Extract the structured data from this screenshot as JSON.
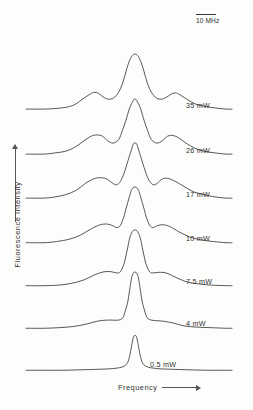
{
  "figure": {
    "axes": {
      "y_label": "Fluorescence  Intensity",
      "x_label": "Frequency"
    },
    "scale_bar": {
      "label": "10 MHz"
    }
  },
  "chart_data": {
    "type": "line",
    "title": "",
    "subtitle": "",
    "xlabel": "Frequency",
    "ylabel": "Fluorescence  Intensity",
    "xlim": [
      -50,
      50
    ],
    "ylim": [
      0,
      1
    ],
    "grid": false,
    "legend_position": "inline-right",
    "annotations": [
      {
        "text": "10 MHz",
        "role": "horizontal-scale-bar",
        "x_px": 196,
        "y_px": 14,
        "length_px": 20
      }
    ],
    "axis_ticks": {
      "x": [],
      "y": []
    },
    "series": [
      {
        "name": "35 mW",
        "power_mw": 35,
        "label": "35 mW",
        "baseline_y_px": 112,
        "peak_center_x_px": 135,
        "peak_height_rel": 1.0,
        "sideband_offset_mhz": 22,
        "sideband_height_rel": 0.34,
        "x": [
          -50,
          -44,
          -38,
          -33,
          -28,
          -24,
          -22,
          -20,
          -17,
          -14,
          -11,
          -8,
          -6,
          -4,
          -2,
          0,
          2,
          4,
          6,
          8,
          11,
          14,
          17,
          20,
          22,
          24,
          28,
          33,
          38,
          44,
          50
        ],
        "values": [
          0.05,
          0.06,
          0.08,
          0.13,
          0.24,
          0.32,
          0.34,
          0.32,
          0.25,
          0.22,
          0.26,
          0.4,
          0.58,
          0.8,
          0.95,
          1.0,
          0.95,
          0.8,
          0.58,
          0.4,
          0.26,
          0.22,
          0.25,
          0.31,
          0.33,
          0.31,
          0.23,
          0.14,
          0.1,
          0.07,
          0.05
        ]
      },
      {
        "name": "26 mW",
        "power_mw": 26,
        "label": "26 mW",
        "baseline_y_px": 157,
        "peak_center_x_px": 135,
        "peak_height_rel": 1.0,
        "sideband_offset_mhz": 18,
        "sideband_height_rel": 0.38,
        "x": [
          -50,
          -44,
          -38,
          -33,
          -28,
          -24,
          -21,
          -18,
          -15,
          -12,
          -9,
          -7,
          -5,
          -3,
          -1,
          0,
          1,
          3,
          5,
          7,
          9,
          12,
          15,
          18,
          21,
          24,
          28,
          33,
          38,
          44,
          50
        ],
        "values": [
          0.05,
          0.07,
          0.1,
          0.17,
          0.28,
          0.36,
          0.38,
          0.36,
          0.28,
          0.24,
          0.3,
          0.45,
          0.63,
          0.84,
          0.97,
          1.0,
          0.97,
          0.84,
          0.63,
          0.45,
          0.3,
          0.24,
          0.28,
          0.36,
          0.37,
          0.33,
          0.24,
          0.15,
          0.1,
          0.07,
          0.05
        ]
      },
      {
        "name": "17 mW",
        "power_mw": 17,
        "label": "17 mW",
        "baseline_y_px": 201,
        "peak_center_x_px": 135,
        "peak_height_rel": 1.0,
        "sideband_offset_mhz": 15,
        "sideband_height_rel": 0.4,
        "x": [
          -50,
          -44,
          -38,
          -32,
          -27,
          -22,
          -18,
          -15,
          -12,
          -10,
          -8,
          -6,
          -4,
          -2,
          -1,
          0,
          1,
          2,
          4,
          6,
          8,
          10,
          12,
          15,
          18,
          22,
          27,
          32,
          38,
          44,
          50
        ],
        "values": [
          0.05,
          0.07,
          0.11,
          0.19,
          0.31,
          0.39,
          0.4,
          0.37,
          0.3,
          0.28,
          0.34,
          0.48,
          0.68,
          0.88,
          0.98,
          1.0,
          0.98,
          0.88,
          0.68,
          0.48,
          0.34,
          0.28,
          0.3,
          0.38,
          0.39,
          0.34,
          0.25,
          0.16,
          0.11,
          0.07,
          0.05
        ]
      },
      {
        "name": "10 mW",
        "power_mw": 10,
        "label": "10 mW",
        "baseline_y_px": 245,
        "peak_center_x_px": 135,
        "peak_height_rel": 1.0,
        "sideband_offset_mhz": 12,
        "sideband_height_rel": 0.36,
        "x": [
          -50,
          -43,
          -36,
          -30,
          -24,
          -19,
          -15,
          -12,
          -10,
          -8,
          -6,
          -5,
          -3,
          -2,
          -1,
          0,
          1,
          2,
          3,
          5,
          6,
          8,
          10,
          12,
          15,
          19,
          24,
          30,
          36,
          43,
          50
        ],
        "values": [
          0.04,
          0.06,
          0.1,
          0.17,
          0.28,
          0.35,
          0.36,
          0.33,
          0.3,
          0.34,
          0.5,
          0.62,
          0.84,
          0.94,
          0.99,
          1.0,
          0.99,
          0.94,
          0.84,
          0.62,
          0.5,
          0.34,
          0.3,
          0.33,
          0.35,
          0.32,
          0.23,
          0.14,
          0.09,
          0.06,
          0.04
        ]
      },
      {
        "name": "7.5 mW",
        "power_mw": 7.5,
        "label": "7.5 mW",
        "baseline_y_px": 288,
        "peak_center_x_px": 135,
        "peak_height_rel": 1.0,
        "sideband_offset_mhz": 10,
        "sideband_height_rel": 0.28,
        "x": [
          -50,
          -42,
          -35,
          -28,
          -22,
          -17,
          -13,
          -10,
          -8,
          -6,
          -5,
          -4,
          -3,
          -2,
          -1,
          0,
          1,
          2,
          3,
          4,
          5,
          6,
          8,
          10,
          13,
          17,
          22,
          28,
          35,
          42,
          50
        ],
        "values": [
          0.04,
          0.05,
          0.08,
          0.14,
          0.23,
          0.28,
          0.28,
          0.26,
          0.28,
          0.42,
          0.55,
          0.7,
          0.85,
          0.94,
          0.99,
          1.0,
          0.99,
          0.94,
          0.85,
          0.7,
          0.55,
          0.42,
          0.28,
          0.26,
          0.27,
          0.26,
          0.19,
          0.11,
          0.07,
          0.05,
          0.04
        ]
      },
      {
        "name": "4 mW",
        "power_mw": 4,
        "label": "4 mW",
        "baseline_y_px": 330,
        "peak_center_x_px": 135,
        "peak_height_rel": 1.0,
        "sideband_offset_mhz": 7,
        "sideband_height_rel": 0.17,
        "x": [
          -50,
          -42,
          -34,
          -27,
          -21,
          -16,
          -12,
          -9,
          -7,
          -6,
          -4,
          -3,
          -2,
          -1.5,
          -1,
          0,
          1,
          1.5,
          2,
          3,
          4,
          6,
          7,
          9,
          12,
          16,
          21,
          27,
          34,
          42,
          50
        ],
        "values": [
          0.03,
          0.04,
          0.06,
          0.1,
          0.15,
          0.17,
          0.17,
          0.17,
          0.2,
          0.26,
          0.48,
          0.68,
          0.88,
          0.94,
          0.98,
          1.0,
          0.98,
          0.94,
          0.88,
          0.68,
          0.48,
          0.26,
          0.2,
          0.17,
          0.16,
          0.15,
          0.12,
          0.07,
          0.05,
          0.04,
          0.03
        ]
      },
      {
        "name": "0.5 mW",
        "power_mw": 0.5,
        "label": "0.5 mW",
        "baseline_y_px": 371,
        "peak_center_x_px": 135,
        "peak_height_rel": 1.0,
        "sideband_offset_mhz": 0,
        "sideband_height_rel": 0.0,
        "x": [
          -50,
          -40,
          -32,
          -25,
          -19,
          -14,
          -10,
          -7,
          -5,
          -4,
          -3,
          -2,
          -1.5,
          -1,
          -0.5,
          0,
          0.5,
          1,
          1.5,
          2,
          3,
          4,
          5,
          7,
          10,
          14,
          19,
          25,
          32,
          40,
          50
        ],
        "values": [
          0.02,
          0.02,
          0.03,
          0.04,
          0.05,
          0.06,
          0.08,
          0.11,
          0.17,
          0.24,
          0.4,
          0.66,
          0.8,
          0.92,
          0.98,
          1.0,
          0.98,
          0.92,
          0.8,
          0.66,
          0.4,
          0.24,
          0.17,
          0.11,
          0.08,
          0.06,
          0.05,
          0.04,
          0.03,
          0.02,
          0.02
        ]
      }
    ]
  }
}
